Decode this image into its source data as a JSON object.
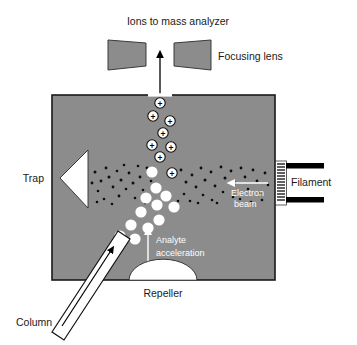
{
  "figure": {
    "type": "schematic-diagram",
    "background_color": "#ffffff",
    "chamber_fill": "#8c8c8c",
    "chamber_stroke": "#1a1a1a",
    "element_fill": "#ffffff",
    "black": "#000000"
  },
  "labels": {
    "ions_to_mass_analyzer": "Ions to mass analyzer",
    "focusing_lens": "Focusing lens",
    "trap": "Trap",
    "filament": "Filament",
    "electron_beam_line1": "Electron",
    "electron_beam_line2": "beam",
    "analyte_acceleration_line1": "Analyte",
    "analyte_acceleration_line2": "acceleration",
    "repeller": "Repeller",
    "column": "Column"
  },
  "ion_charge_glyph": "+",
  "geometry": {
    "chamber": {
      "x": 52,
      "y": 95,
      "width": 223,
      "height": 185
    },
    "top_slit": {
      "x": 148,
      "y": 95,
      "width": 24
    },
    "exit_arrow": {
      "x": 160,
      "from_y": 95,
      "to_y": 52
    },
    "focusing_lens_left": "M108,40 L146,43 L146,66 L108,70 Z",
    "focusing_lens_right": "M174,43 L211,40 L211,70 L174,66 Z",
    "trap_triangle": "M88,150 L60,178 L88,208 Z",
    "repeller_dome": {
      "cx": 163,
      "cy": 281,
      "rx": 34,
      "ry": 20
    },
    "filament_coil": {
      "x": 277,
      "y": 163,
      "width": 9,
      "height": 40,
      "turns": 13
    },
    "filament_bar_top": {
      "x": 286,
      "y": 164,
      "width": 38,
      "height": 6
    },
    "filament_bar_bottom": {
      "x": 286,
      "y": 198,
      "width": 38,
      "height": 6
    },
    "electron_beam_arrow": {
      "x1": 268,
      "x2": 230,
      "y": 183
    },
    "analyte_arrow": {
      "x": 148,
      "y1": 266,
      "y2": 230
    },
    "column_tube": "M55,330 L120,232 L132,240 L66,338 Z",
    "column_inner_arrow": {
      "x1": 72,
      "y1": 318,
      "x2": 118,
      "y2": 248
    }
  },
  "ions": [
    {
      "cx": 160,
      "cy": 103,
      "r": 5.2
    },
    {
      "cx": 153,
      "cy": 116,
      "r": 5.2
    },
    {
      "cx": 170,
      "cy": 121,
      "r": 5.2
    },
    {
      "cx": 163,
      "cy": 133,
      "r": 5.2
    },
    {
      "cx": 152,
      "cy": 145,
      "r": 5.2
    },
    {
      "cx": 171,
      "cy": 147,
      "r": 5.2
    },
    {
      "cx": 160,
      "cy": 157,
      "r": 5.2
    },
    {
      "cx": 172,
      "cy": 173,
      "r": 5.2
    }
  ],
  "analyte_molecules": [
    {
      "cx": 152,
      "cy": 172,
      "r": 5.6
    },
    {
      "cx": 156,
      "cy": 188,
      "r": 5.6
    },
    {
      "cx": 166,
      "cy": 196,
      "r": 5.6
    },
    {
      "cx": 146,
      "cy": 198,
      "r": 5.6
    },
    {
      "cx": 157,
      "cy": 205,
      "r": 5.6
    },
    {
      "cx": 174,
      "cy": 207,
      "r": 5.6
    },
    {
      "cx": 141,
      "cy": 212,
      "r": 5.6
    },
    {
      "cx": 159,
      "cy": 220,
      "r": 5.6
    },
    {
      "cx": 131,
      "cy": 225,
      "r": 5.6
    },
    {
      "cx": 148,
      "cy": 228,
      "r": 5.6
    },
    {
      "cx": 120,
      "cy": 236,
      "r": 5.6
    },
    {
      "cx": 135,
      "cy": 239,
      "r": 5.6
    }
  ],
  "electron_dots_note": "dense horizontal band of small black dots between trap and filament",
  "electron_dot_band": {
    "x_min": 92,
    "x_max": 272,
    "y_min": 163,
    "y_max": 205
  }
}
